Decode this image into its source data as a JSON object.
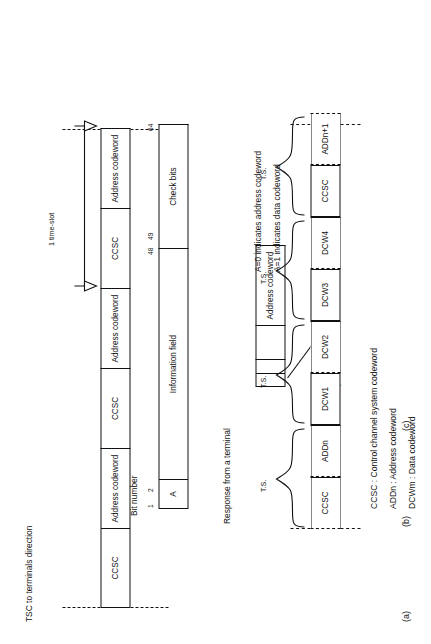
{
  "figure": {
    "panels": [
      {
        "id": "a",
        "label": "(a)",
        "caption": "TSC to terminals direction",
        "timeslot_label": "1 time-slot",
        "cells": [
          "CCSC",
          "Address codeword",
          "CCSC",
          "Address codeword",
          "CCSC",
          "Address codeword"
        ]
      },
      {
        "id": "b",
        "label": "(b)",
        "response_caption": "Response from a terminal",
        "sync_label": "Synchronization bits",
        "response_cells": [
          "",
          "",
          "",
          "Address codeword"
        ],
        "bit_number_label": "Bit number",
        "bit_ticks": [
          "1",
          "2",
          "48",
          "49",
          "64"
        ],
        "frame_cells": [
          "A",
          "Information field",
          "Check bits"
        ],
        "notes": [
          "A=0 indicates address codeword",
          "A=1 indicates data codeword"
        ]
      },
      {
        "id": "c",
        "label": "(c)",
        "cells": [
          "CCSC",
          "ADDn",
          "DCW1",
          "DCW2",
          "DCW3",
          "DCW4",
          "CCSC",
          "ADDn+1"
        ],
        "ts_label": "T.S.",
        "ts_count": 4
      }
    ],
    "legend": [
      "CCSC : Control channel system codeword",
      "ADDn : Address codeword",
      "DCWm : Data codeword"
    ]
  }
}
